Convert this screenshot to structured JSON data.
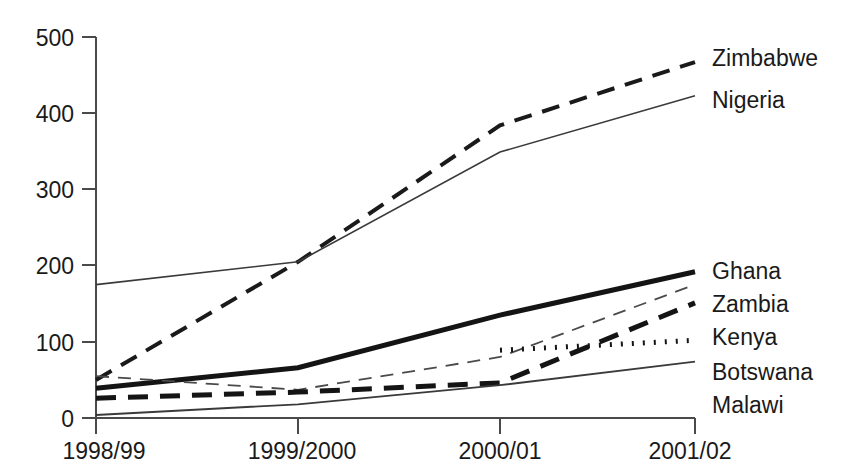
{
  "chart_data": {
    "type": "line",
    "title": "",
    "subtitle": "",
    "xlabel": "",
    "ylabel": "",
    "categories": [
      "1998/99",
      "1999/2000",
      "2000/01",
      "2001/02"
    ],
    "ylim": [
      0,
      500
    ],
    "yticks": [
      0,
      100,
      200,
      300,
      400,
      500
    ],
    "ytick_labels": [
      "0",
      "100",
      "200",
      "300",
      "400",
      "500"
    ],
    "grid": false,
    "legend_position": "right-inline-labels",
    "series": [
      {
        "name": "Zimbabwe",
        "values": [
          50,
          205,
          384,
          467
        ],
        "style": "long-dash",
        "color": "#1a1a1a",
        "width": 4.0,
        "dasharray": "18,11",
        "label_x": 712,
        "label_y": 66
      },
      {
        "name": "Nigeria",
        "values": [
          175,
          205,
          349,
          423
        ],
        "style": "thin-solid",
        "color": "#3a3a3a",
        "width": 1.6,
        "dasharray": "none",
        "label_x": 712,
        "label_y": 108
      },
      {
        "name": "Ghana",
        "values": [
          39,
          66,
          135,
          192
        ],
        "style": "thick-solid",
        "color": "#141414",
        "width": 5.0,
        "dasharray": "none",
        "label_x": 712,
        "label_y": 279
      },
      {
        "name": "Zambia",
        "values": [
          55,
          37,
          80,
          175
        ],
        "style": "thin-dash",
        "color": "#4a4a4a",
        "width": 1.8,
        "dasharray": "13,9",
        "label_x": 712,
        "label_y": 312
      },
      {
        "name": "Kenya",
        "values": [
          26,
          34,
          46,
          151
        ],
        "style": "bold-dash",
        "color": "#141414",
        "width": 5.0,
        "dasharray": "20,12",
        "label_x": 712,
        "label_y": 345
      },
      {
        "name": "Botswana",
        "values": [
          null,
          null,
          89,
          102
        ],
        "style": "dotted",
        "color": "#141414",
        "width": 5.0,
        "dasharray": "2,9",
        "label_x": 712,
        "label_y": 380
      },
      {
        "name": "Malawi",
        "values": [
          4,
          18,
          43,
          74
        ],
        "style": "thin-solid",
        "color": "#3a3a3a",
        "width": 1.8,
        "dasharray": "none",
        "label_x": 712,
        "label_y": 413
      }
    ]
  },
  "axis": {
    "y_tick_labels": [
      "500",
      "400",
      "300",
      "200",
      "100",
      "0"
    ],
    "x_tick_labels": [
      "1998/99",
      "1999/2000",
      "2000/01",
      "2001/02"
    ]
  },
  "labels": {
    "zimbabwe": "Zimbabwe",
    "nigeria": "Nigeria",
    "ghana": "Ghana",
    "zambia": "Zambia",
    "kenya": "Kenya",
    "botswana": "Botswana",
    "malawi": "Malawi"
  }
}
